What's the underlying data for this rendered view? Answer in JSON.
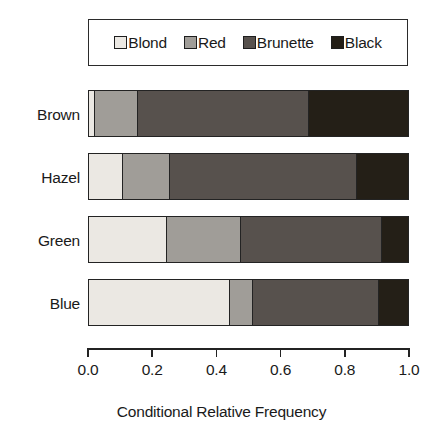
{
  "chart_data": {
    "type": "bar",
    "orientation": "horizontal",
    "stacked": true,
    "title": "",
    "xlabel": "Conditional Relative Frequency",
    "ylabel": "",
    "xlim": [
      0.0,
      1.0
    ],
    "grid": false,
    "legend_position": "top",
    "categories": [
      "Brown",
      "Hazel",
      "Green",
      "Blue"
    ],
    "tick_labels": [
      "0.0",
      "0.2",
      "0.4",
      "0.6",
      "0.8",
      "1.0"
    ],
    "tick_values": [
      0.0,
      0.2,
      0.4,
      0.6,
      0.8,
      1.0
    ],
    "series": [
      {
        "name": "Blond",
        "color": "#ebe8e3",
        "values": [
          0.02,
          0.105,
          0.245,
          0.443
        ]
      },
      {
        "name": "Red",
        "color": "#a09d98",
        "values": [
          0.135,
          0.15,
          0.23,
          0.072
        ]
      },
      {
        "name": "Brunette",
        "color": "#57514d",
        "values": [
          0.535,
          0.585,
          0.445,
          0.395
        ]
      },
      {
        "name": "Black",
        "color": "#241f17",
        "values": [
          0.31,
          0.16,
          0.08,
          0.09
        ]
      }
    ]
  },
  "legend": {
    "items": [
      {
        "label": "Blond",
        "color": "#ebe8e3"
      },
      {
        "label": "Red",
        "color": "#a09d98"
      },
      {
        "label": "Brunette",
        "color": "#57514d"
      },
      {
        "label": "Black",
        "color": "#241f17"
      }
    ]
  },
  "axis": {
    "title": "Conditional Relative Frequency"
  }
}
